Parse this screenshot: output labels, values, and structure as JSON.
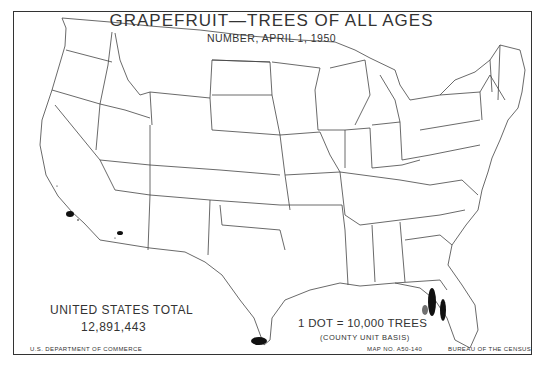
{
  "map": {
    "title": "GRAPEFRUIT—TREES OF ALL AGES",
    "subtitle": "NUMBER, APRIL 1, 1950",
    "total": {
      "label": "UNITED STATES TOTAL",
      "value": "12,891,443"
    },
    "legend": {
      "dot_value": "1 DOT = 10,000 TREES",
      "basis": "(COUNTY UNIT BASIS)"
    },
    "footer": {
      "left": "U.S. DEPARTMENT OF COMMERCE",
      "map_number": "MAP NO. A50-140",
      "right": "BUREAU OF THE CENSUS"
    },
    "concentrations": [
      {
        "region": "Florida (central ridge & Indian River)",
        "density": "very high"
      },
      {
        "region": "Texas (Lower Rio Grande Valley)",
        "density": "high"
      },
      {
        "region": "California (southern)",
        "density": "moderate"
      },
      {
        "region": "Arizona (Salt River Valley)",
        "density": "moderate"
      }
    ],
    "colors": {
      "ink": "#222222",
      "background": "#ffffff",
      "dots": "#111111"
    }
  }
}
